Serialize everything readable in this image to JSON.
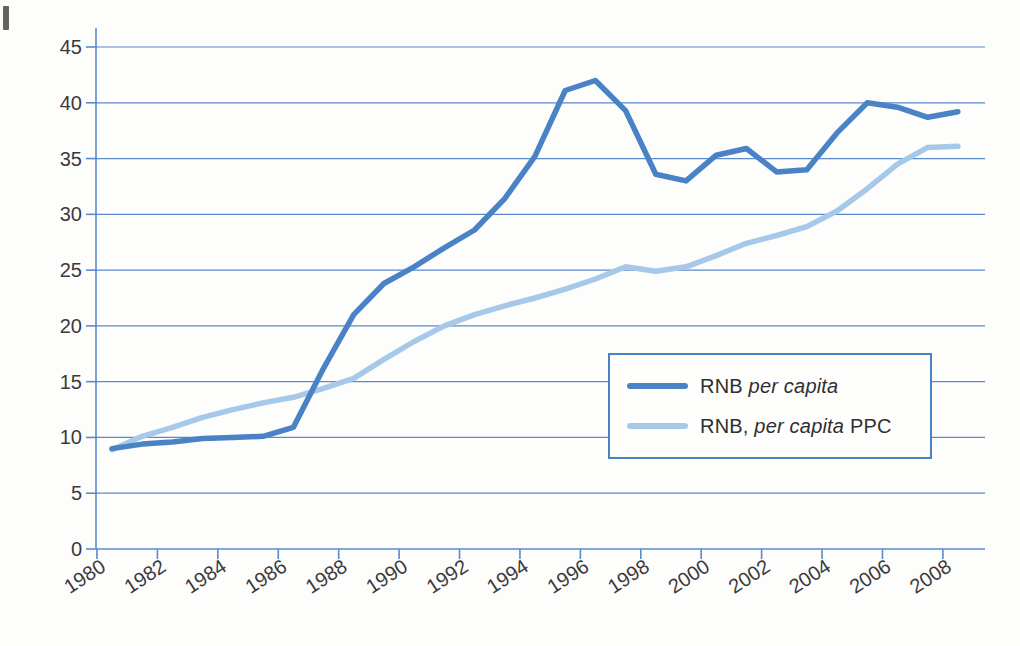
{
  "chart_data": {
    "type": "line",
    "title": "",
    "xlabel": "",
    "ylabel": "",
    "x": [
      1980,
      1981,
      1982,
      1983,
      1984,
      1985,
      1986,
      1987,
      1988,
      1989,
      1990,
      1991,
      1992,
      1993,
      1994,
      1995,
      1996,
      1997,
      1998,
      1999,
      2000,
      2001,
      2002,
      2003,
      2004,
      2005,
      2006,
      2007,
      2008
    ],
    "x_tick_labels": [
      "1980",
      "1982",
      "1984",
      "1986",
      "1988",
      "1990",
      "1992",
      "1994",
      "1996",
      "1998",
      "2000",
      "2002",
      "2004",
      "2006",
      "2008"
    ],
    "yticks": [
      0,
      5,
      10,
      15,
      20,
      25,
      30,
      35,
      40,
      45
    ],
    "ylim": [
      0,
      45
    ],
    "grid": "horizontal",
    "legend_position": "inside-right-middle",
    "series": [
      {
        "name": "RNB per capita",
        "color": "#4a82c6",
        "values": [
          9.0,
          9.4,
          9.6,
          9.9,
          10.0,
          10.1,
          10.9,
          16.2,
          21.0,
          23.8,
          25.3,
          27.0,
          28.6,
          31.4,
          35.2,
          41.1,
          42.0,
          39.3,
          33.6,
          33.0,
          35.3,
          35.9,
          33.8,
          34.0,
          37.3,
          40.0,
          39.6,
          38.7,
          39.2
        ]
      },
      {
        "name": "RNB, per capita PPC",
        "color": "#a6c9e9",
        "values": [
          8.9,
          10.1,
          10.9,
          11.8,
          12.5,
          13.1,
          13.6,
          14.4,
          15.3,
          17.0,
          18.6,
          20.0,
          21.0,
          21.8,
          22.5,
          23.3,
          24.2,
          25.3,
          24.9,
          25.3,
          26.3,
          27.4,
          28.1,
          28.9,
          30.3,
          32.3,
          34.5,
          36.0,
          36.1
        ]
      }
    ]
  },
  "legend": {
    "items": [
      {
        "prefix": "RNB ",
        "italic": "per capita",
        "suffix": ""
      },
      {
        "prefix": "RNB, ",
        "italic": "per capita",
        "suffix": " PPC"
      }
    ]
  },
  "colors": {
    "grid_line": "#5b89cc",
    "axis_line": "#5b89cc",
    "tick_text": "#3a3a3e",
    "legend_border": "#4a82c6",
    "series_1": "#4a82c6",
    "series_2": "#a6c9e9"
  }
}
